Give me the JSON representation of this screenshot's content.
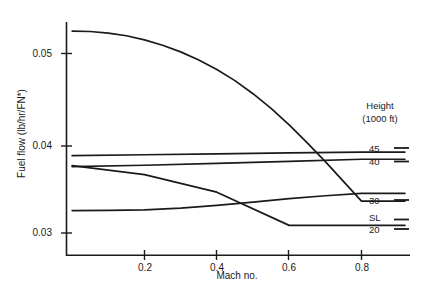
{
  "chart_data": {
    "type": "line",
    "title": "",
    "xlabel": "Mach no.",
    "ylabel": "Fuel flow (lb/hr/FN*)",
    "xlim": [
      0.0,
      0.92
    ],
    "ylim": [
      0.0285,
      0.0545
    ],
    "xticks": [
      0.2,
      0.4,
      0.6,
      0.8
    ],
    "xtick_labels": [
      "0.2",
      "0.4",
      "0.6",
      "0.8"
    ],
    "yticks": [
      0.03,
      0.04,
      0.05
    ],
    "ytick_labels": [
      "0.03",
      "0.04",
      "0.05"
    ],
    "grid": false,
    "legend_position": "right",
    "legend_title": "Height (1000 ft)",
    "series": [
      {
        "name": "SL",
        "label": "SL",
        "x": [
          0.0,
          0.05,
          0.1,
          0.15,
          0.2,
          0.25,
          0.3,
          0.35,
          0.4,
          0.45,
          0.5,
          0.55,
          0.6,
          0.65,
          0.7,
          0.75,
          0.8,
          0.92
        ],
        "values": [
          0.0525,
          0.05245,
          0.05228,
          0.05198,
          0.05152,
          0.05092,
          0.05018,
          0.04928,
          0.04822,
          0.04698,
          0.04552,
          0.04388,
          0.04205,
          0.04005,
          0.03795,
          0.03575,
          0.03355,
          0.03355
        ]
      },
      {
        "name": "20",
        "label": "20",
        "x": [
          0.0,
          0.2,
          0.4,
          0.6,
          0.8,
          0.92
        ],
        "values": [
          0.0375,
          0.0365,
          0.03455,
          0.03085,
          0.03085,
          0.03085
        ]
      },
      {
        "name": "30",
        "label": "30",
        "x": [
          0.0,
          0.1,
          0.2,
          0.3,
          0.4,
          0.5,
          0.6,
          0.7,
          0.8,
          0.92
        ],
        "values": [
          0.0325,
          0.03252,
          0.03258,
          0.03278,
          0.03308,
          0.03345,
          0.03382,
          0.03415,
          0.03442,
          0.03442
        ]
      },
      {
        "name": "40",
        "label": "40",
        "x": [
          0.0,
          0.2,
          0.4,
          0.6,
          0.8,
          0.92
        ],
        "values": [
          0.0374,
          0.03755,
          0.03775,
          0.03798,
          0.03822,
          0.03822
        ]
      },
      {
        "name": "45",
        "label": "45",
        "x": [
          0.0,
          0.2,
          0.4,
          0.6,
          0.8,
          0.92
        ],
        "values": [
          0.03862,
          0.03872,
          0.03882,
          0.03892,
          0.03902,
          0.03902
        ]
      }
    ],
    "legend_entries": [
      {
        "label": "45"
      },
      {
        "label": "40"
      },
      {
        "label": "30"
      },
      {
        "label": "SL"
      },
      {
        "label": "20"
      }
    ],
    "colors": {
      "line": "#1a1a1a",
      "axis": "#1a1a1a",
      "background": "#ffffff",
      "text": "#1a1a1a"
    }
  },
  "axes": {
    "y_title": "Fuel flow (lb/hr/FN*)",
    "x_title": "Mach no.",
    "ytick_0": "0.05",
    "ytick_1": "0.04",
    "ytick_2": "0.03",
    "xtick_0": "0.2",
    "xtick_1": "0.4",
    "xtick_2": "0.6",
    "xtick_3": "0.8"
  },
  "legend": {
    "title_line1": "Height",
    "title_line2": "(1000 ft)",
    "item_45": "45",
    "item_40": "40",
    "item_30": "30",
    "item_SL": "SL",
    "item_20": "20"
  }
}
